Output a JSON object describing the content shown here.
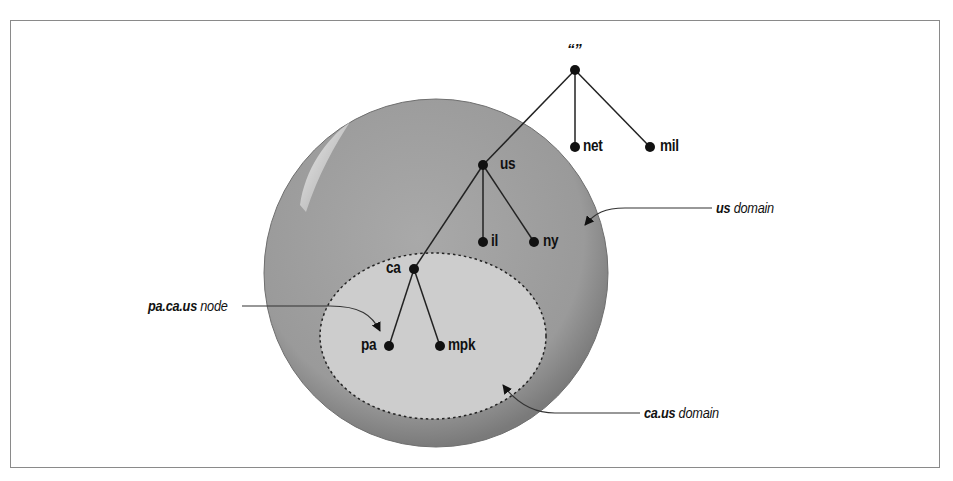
{
  "diagram": {
    "title": "",
    "root": {
      "label": "“”"
    },
    "nodes": {
      "net": "net",
      "mil": "mil",
      "us": "us",
      "il": "il",
      "ny": "ny",
      "ca": "ca",
      "pa": "pa",
      "mpk": "mpk"
    },
    "callouts": {
      "us_domain": {
        "bold": "us",
        "rest": " domain"
      },
      "ca_us_domain": {
        "bold": "ca.us",
        "rest": " domain"
      },
      "pa_ca_us_node": {
        "bold": "pa.ca.us",
        "rest": " node"
      }
    },
    "tree_edges": [
      [
        "root",
        "us"
      ],
      [
        "root",
        "net"
      ],
      [
        "root",
        "mil"
      ],
      [
        "us",
        "il"
      ],
      [
        "us",
        "ny"
      ],
      [
        "us",
        "ca"
      ],
      [
        "ca",
        "pa"
      ],
      [
        "ca",
        "mpk"
      ]
    ],
    "colors": {
      "outer_domain_fill": "#9c9c9c",
      "inner_domain_fill": "#cfcfcf",
      "node": "#111111",
      "line": "#222222",
      "frame": "#8a8a8a"
    }
  }
}
